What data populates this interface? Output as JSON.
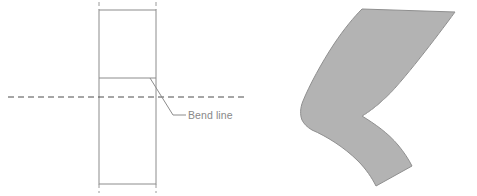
{
  "figure": {
    "background_color": "#ffffff",
    "width": 477,
    "height": 196
  },
  "flat_pattern": {
    "name": "flat-blank-rectangle",
    "outline_color": "#8c8c8c",
    "fill_color": "#ffffff",
    "rect": {
      "x": 99,
      "y": 10,
      "width": 57,
      "height": 174
    },
    "bend_line": {
      "label": "Bend line",
      "color": "#8c8c8c",
      "y": 78,
      "x_start": 99,
      "x_end": 156
    },
    "centerline_horizontal": {
      "name": "horizontal-centerline",
      "color": "#4d4d4d",
      "y": 97,
      "x_start": 8,
      "x_end": 248,
      "dash": "6 4"
    },
    "centerline_vertical_left": {
      "name": "left-edge-centerline",
      "color": "#8c8c8c",
      "x": 99,
      "dash": "4 3"
    },
    "centerline_vertical_right": {
      "name": "right-edge-centerline",
      "color": "#8c8c8c",
      "x": 156,
      "dash": "4 3"
    },
    "leader": {
      "name": "bend-line-leader",
      "color": "#8c8c8c",
      "points": "150,78 173,115 186,115"
    },
    "label_position": {
      "x": 188,
      "y": 119
    }
  },
  "formed_part": {
    "name": "formed-c-shaped-part",
    "fill_color": "#b3b3b3",
    "outline_color": "#8f8f8f",
    "description": "C-shaped curved sheet metal part formed from the flat blank"
  }
}
